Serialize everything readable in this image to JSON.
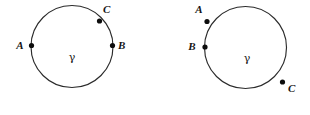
{
  "figure": {
    "name": "two-circles-point-ordering-diagram",
    "background_color": "#ffffff",
    "stroke_color": "#2b2b2b",
    "dot_color": "#0d0d0d",
    "width": 310,
    "height": 115
  },
  "diagrams": [
    {
      "id": "left",
      "curve_label": "γ",
      "curve_label_x": 72,
      "curve_label_y": 61,
      "circle": {
        "cx": 72,
        "cy": 46.5,
        "r": 41
      },
      "points": [
        {
          "label": "A",
          "cx": 31.5,
          "cy": 45.5,
          "label_x": 20,
          "label_y": 49,
          "r": 2.6
        },
        {
          "label": "B",
          "cx": 112.5,
          "cy": 45.5,
          "label_x": 118,
          "label_y": 49,
          "r": 2.6
        },
        {
          "label": "C",
          "cx": 99.5,
          "cy": 21.0,
          "label_x": 103,
          "label_y": 13,
          "r": 2.6
        }
      ]
    },
    {
      "id": "right",
      "curve_label": "γ",
      "curve_label_x": 247,
      "curve_label_y": 62,
      "circle": {
        "cx": 245.5,
        "cy": 47.5,
        "r": 41
      },
      "points": [
        {
          "label": "A",
          "cx": 207.0,
          "cy": 21.5,
          "label_x": 199,
          "label_y": 13,
          "r": 2.6
        },
        {
          "label": "B",
          "cx": 205.0,
          "cy": 47.0,
          "label_x": 192,
          "label_y": 50,
          "r": 2.6
        },
        {
          "label": "C",
          "cx": 282.5,
          "cy": 82.0,
          "label_x": 288,
          "label_y": 92,
          "r": 2.6
        }
      ]
    }
  ]
}
